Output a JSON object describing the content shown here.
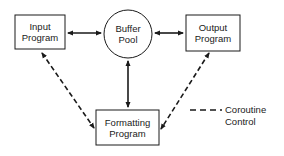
{
  "diagram": {
    "nodes": [
      {
        "id": "input",
        "shape": "rect",
        "line1": "Input",
        "line2": "Program"
      },
      {
        "id": "buffer",
        "shape": "circle",
        "line1": "Buffer",
        "line2": "Pool"
      },
      {
        "id": "output",
        "shape": "rect",
        "line1": "Output",
        "line2": "Program"
      },
      {
        "id": "formatting",
        "shape": "rect",
        "line1": "Formatting",
        "line2": "Program"
      }
    ],
    "edges": [
      {
        "from": "input",
        "to": "buffer",
        "style": "solid",
        "direction": "both"
      },
      {
        "from": "buffer",
        "to": "output",
        "style": "solid",
        "direction": "both"
      },
      {
        "from": "buffer",
        "to": "formatting",
        "style": "solid",
        "direction": "both"
      },
      {
        "from": "input",
        "to": "formatting",
        "style": "dashed",
        "direction": "both"
      },
      {
        "from": "output",
        "to": "formatting",
        "style": "dashed",
        "direction": "both"
      }
    ],
    "legend": {
      "line_style": "dashed",
      "line1": "Coroutine",
      "line2": "Control"
    },
    "colors": {
      "stroke": "#1a1a1a",
      "background": "#ffffff"
    }
  }
}
